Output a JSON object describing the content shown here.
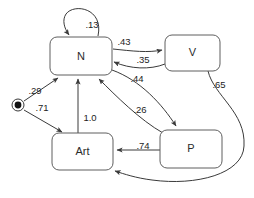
{
  "diagram": {
    "type": "state-transition-diagram",
    "background_color": "#ffffff",
    "node_stroke_color": "#5f5f5f",
    "edge_color": "#3a3a3a",
    "text_color": "#1d1d1d",
    "start_marker": {
      "name": "start-state-marker",
      "shape": "filled-circle-with-ring",
      "cx": 18,
      "cy": 105,
      "ring_r": 6,
      "dot_r": 3.4
    },
    "nodes": [
      {
        "id": "N",
        "label": "N",
        "x": 50,
        "y": 37,
        "w": 62,
        "h": 38
      },
      {
        "id": "V",
        "label": "V",
        "x": 165,
        "y": 35,
        "w": 55,
        "h": 36
      },
      {
        "id": "Art",
        "label": "Art",
        "x": 52,
        "y": 133,
        "w": 61,
        "h": 37
      },
      {
        "id": "P",
        "label": "P",
        "x": 160,
        "y": 130,
        "w": 62,
        "h": 38
      }
    ],
    "edges": [
      {
        "id": "start-to-N",
        "from": "start",
        "to": "N",
        "label": ".29",
        "lx": 35,
        "ly": 91
      },
      {
        "id": "start-to-Art",
        "from": "start",
        "to": "Art",
        "label": ".71",
        "lx": 42,
        "ly": 108
      },
      {
        "id": "N-self",
        "from": "N",
        "to": "N",
        "label": ".13",
        "lx": 92,
        "ly": 25
      },
      {
        "id": "N-to-V",
        "from": "N",
        "to": "V",
        "label": ".43",
        "lx": 124,
        "ly": 42
      },
      {
        "id": "V-to-N",
        "from": "V",
        "to": "N",
        "label": ".35",
        "lx": 143,
        "ly": 60
      },
      {
        "id": "N-to-P",
        "from": "N",
        "to": "P",
        "label": ".44",
        "lx": 137,
        "ly": 79
      },
      {
        "id": "P-to-N",
        "from": "P",
        "to": "N",
        "label": ".26",
        "lx": 140,
        "ly": 110
      },
      {
        "id": "Art-to-N",
        "from": "Art",
        "to": "N",
        "label": "1.0",
        "lx": 90,
        "ly": 118
      },
      {
        "id": "P-to-Art",
        "from": "P",
        "to": "Art",
        "label": ".74",
        "lx": 143,
        "ly": 146
      },
      {
        "id": "V-to-Art",
        "from": "V",
        "to": "Art",
        "label": ".65",
        "lx": 219,
        "ly": 85
      }
    ]
  }
}
